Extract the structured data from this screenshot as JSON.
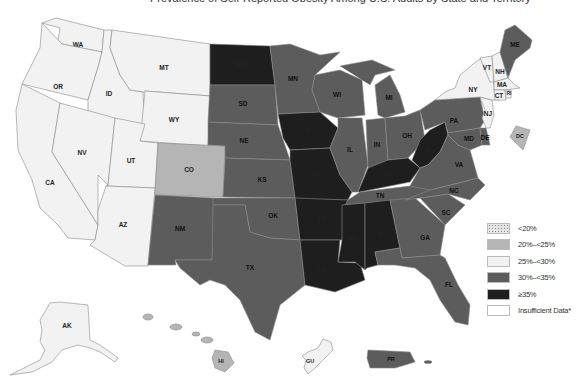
{
  "title": "Prevalence of Self-Reported Obesity Among U.S. Adults by State and Territory",
  "legend": {
    "title": "",
    "items": [
      {
        "label": "<20%",
        "color": "#e6e6e6",
        "pattern": "dots"
      },
      {
        "label": "20%–<25%",
        "color": "#b5b5b5"
      },
      {
        "label": "25%–<30%",
        "color": "#f2f2f2"
      },
      {
        "label": "30%–<35%",
        "color": "#5c5c5c"
      },
      {
        "label": "≥35%",
        "color": "#1e1e1e"
      },
      {
        "label": "Insufficient Data*",
        "color": "#ffffff"
      }
    ]
  },
  "colors": {
    "lt20": "#e6e6e6",
    "c20_25": "#b5b5b5",
    "c25_30": "#f2f2f2",
    "c30_35": "#5c5c5c",
    "ge35": "#1e1e1e",
    "insufficient": "#ffffff",
    "border": "#8a8a8a"
  },
  "states": {
    "WA": {
      "label": "WA",
      "category": "25%–<30%"
    },
    "OR": {
      "label": "OR",
      "category": "25%–<30%"
    },
    "CA": {
      "label": "CA",
      "category": "25%–<30%"
    },
    "ID": {
      "label": "ID",
      "category": "25%–<30%"
    },
    "NV": {
      "label": "NV",
      "category": "25%–<30%"
    },
    "MT": {
      "label": "MT",
      "category": "25%–<30%"
    },
    "WY": {
      "label": "WY",
      "category": "25%–<30%"
    },
    "UT": {
      "label": "UT",
      "category": "25%–<30%"
    },
    "AZ": {
      "label": "AZ",
      "category": "25%–<30%"
    },
    "CO": {
      "label": "CO",
      "category": "20%–<25%"
    },
    "NM": {
      "label": "NM",
      "category": "30%–<35%"
    },
    "ND": {
      "label": "ND",
      "category": "≥35%"
    },
    "SD": {
      "label": "SD",
      "category": "30%–<35%"
    },
    "NE": {
      "label": "NE",
      "category": "30%–<35%"
    },
    "KS": {
      "label": "KS",
      "category": "30%–<35%"
    },
    "OK": {
      "label": "OK",
      "category": "30%–<35%"
    },
    "TX": {
      "label": "TX",
      "category": "30%–<35%"
    },
    "MN": {
      "label": "MN",
      "category": "30%–<35%"
    },
    "IA": {
      "label": "IA",
      "category": "≥35%"
    },
    "MO": {
      "label": "MO",
      "category": "≥35%"
    },
    "AR": {
      "label": "AR",
      "category": "≥35%"
    },
    "LA": {
      "label": "LA",
      "category": "≥35%"
    },
    "WI": {
      "label": "WI",
      "category": "30%–<35%"
    },
    "IL": {
      "label": "IL",
      "category": "30%–<35%"
    },
    "MI": {
      "label": "MI",
      "category": "30%–<35%"
    },
    "IN": {
      "label": "IN",
      "category": "30%–<35%"
    },
    "OH": {
      "label": "OH",
      "category": "30%–<35%"
    },
    "KY": {
      "label": "KY",
      "category": "≥35%"
    },
    "TN": {
      "label": "TN",
      "category": "30%–<35%"
    },
    "MS": {
      "label": "MS",
      "category": "≥35%"
    },
    "AL": {
      "label": "AL",
      "category": "≥35%"
    },
    "GA": {
      "label": "GA",
      "category": "30%–<35%"
    },
    "FL": {
      "label": "FL",
      "category": "30%–<35%"
    },
    "SC": {
      "label": "SC",
      "category": "30%–<35%"
    },
    "NC": {
      "label": "NC",
      "category": "30%–<35%"
    },
    "VA": {
      "label": "VA",
      "category": "30%–<35%"
    },
    "WV": {
      "label": "WV",
      "category": "≥35%"
    },
    "PA": {
      "label": "PA",
      "category": "30%–<35%"
    },
    "NY": {
      "label": "NY",
      "category": "25%–<30%"
    },
    "VT": {
      "label": "VT",
      "category": "25%–<30%"
    },
    "NH": {
      "label": "NH",
      "category": "25%–<30%"
    },
    "ME": {
      "label": "ME",
      "category": "30%–<35%"
    },
    "MA": {
      "label": "MA",
      "category": "25%–<30%"
    },
    "RI": {
      "label": "RI",
      "category": "25%–<30%"
    },
    "CT": {
      "label": "CT",
      "category": "25%–<30%"
    },
    "NJ": {
      "label": "NJ",
      "category": "25%–<30%"
    },
    "DE": {
      "label": "DE",
      "category": "30%–<35%"
    },
    "MD": {
      "label": "MD",
      "category": "30%–<35%"
    },
    "DC": {
      "label": "DC",
      "category": "20%–<25%"
    },
    "AK": {
      "label": "AK",
      "category": "25%–<30%"
    },
    "HI": {
      "label": "HI",
      "category": "20%–<25%"
    },
    "GU": {
      "label": "GU",
      "category": "25%–<30%"
    },
    "PR": {
      "label": "PR",
      "category": "30%–<35%"
    }
  }
}
